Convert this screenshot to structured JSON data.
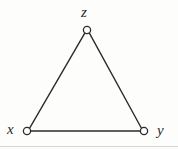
{
  "figure": {
    "kind": "undirected-graph-diagram",
    "background_color": "#fdfdfc",
    "stroke_color": "#2b2b2b",
    "vertex_fill_color": "#ffffff",
    "canvas": {
      "width": 178,
      "height": 149
    },
    "artifact_line_color": "#d8d6d2"
  },
  "graph": {
    "vertices": [
      {
        "id": "z",
        "label": "z",
        "cx": 87,
        "cy": 30,
        "r": 3.6,
        "label_position": "above"
      },
      {
        "id": "x",
        "label": "x",
        "cx": 27,
        "cy": 131,
        "r": 3.6,
        "label_position": "left"
      },
      {
        "id": "y",
        "label": "y",
        "cx": 144,
        "cy": 131,
        "r": 3.6,
        "label_position": "right"
      }
    ],
    "edges": [
      {
        "id": "edge-x-z",
        "from": "x",
        "to": "z",
        "x1": 29.5,
        "y1": 128.4,
        "x2": 84.8,
        "y2": 33.2
      },
      {
        "id": "edge-z-y",
        "from": "z",
        "to": "y",
        "x1": 89.4,
        "y1": 33.2,
        "x2": 141.6,
        "y2": 128.5
      },
      {
        "id": "edge-x-y",
        "from": "x",
        "to": "y",
        "x1": 30.6,
        "y1": 131.0,
        "x2": 140.4,
        "y2": 131.0
      }
    ]
  }
}
